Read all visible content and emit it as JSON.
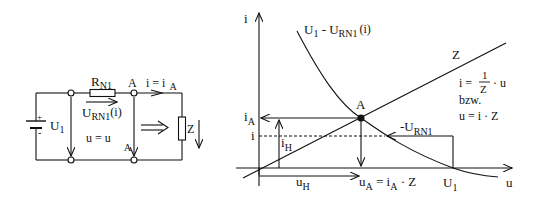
{
  "circuit": {
    "resistor_label": "R",
    "resistor_sub": "N1",
    "node_label": "A",
    "current_label": "i = i",
    "current_sub": "A",
    "source_plus": "+",
    "source_minus": "-",
    "source_label": "U",
    "source_sub": "1",
    "drop_label": "U",
    "drop_sub": "RN1",
    "drop_arg": "(i)",
    "voltage_label": "u = u",
    "voltage_sub": "A",
    "load_label": "Z"
  },
  "graph": {
    "y_axis_label": "i",
    "x_axis_label": "u",
    "curve_label": "U",
    "curve_sub1": "1",
    "curve_mid": " - U",
    "curve_sub2": "RN1",
    "curve_arg": "(i)",
    "line_label": "Z",
    "eq1_left": "i =",
    "eq1_num": "1",
    "eq1_den": "Z",
    "eq1_right": "· u",
    "eq_or": "bzw.",
    "eq2": "u = i · Z",
    "point_label": "A",
    "iA_label": "i",
    "iA_sub": "A",
    "i_label": "i",
    "iH_label": "i",
    "iH_sub": "H",
    "uH_label": "u",
    "uH_sub": "H",
    "uA_label": "u",
    "uA_sub": "A",
    "uA_eq": " = i",
    "uA_eq_sub": "A",
    "uA_eq_end": " · Z",
    "U1_label": "U",
    "U1_sub": "1",
    "drop_label": "-U",
    "drop_sub": "RN1"
  }
}
